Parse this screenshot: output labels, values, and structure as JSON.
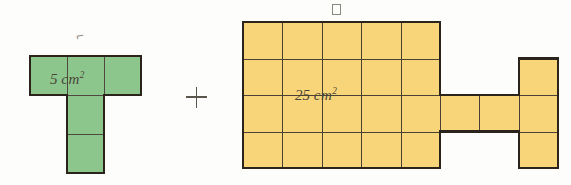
{
  "page": {
    "width": 571,
    "height": 185,
    "background": "#fdfdfb"
  },
  "colors": {
    "green_fill": "#8cc68c",
    "yellow_fill": "#f7d578",
    "grid_stroke": "#4a4033",
    "outline_stroke": "#2b241c",
    "label_text": "#4a443a",
    "tag_text": "#8d8a82"
  },
  "operator": {
    "symbol": "+",
    "name": "plus-sign",
    "x": 186,
    "y": 87
  },
  "figures": [
    {
      "id": "green-figure",
      "tag": "⌐",
      "tag_kind": "faint-mark",
      "fill": "#8cc68c",
      "area_value": "5",
      "area_unit": "cm",
      "area_exponent": "2",
      "area_label": "5 cm²",
      "cell_width": 37,
      "cell_height": 39,
      "origin_x": 30,
      "origin_y": 56,
      "grid": [
        {
          "col": 0,
          "row": 0
        },
        {
          "col": 1,
          "row": 0
        },
        {
          "col": 2,
          "row": 0
        },
        {
          "col": 1,
          "row": 1
        },
        {
          "col": 1,
          "row": 2
        }
      ],
      "cell_count": 5,
      "label_offset_x": 20,
      "label_offset_y": 14,
      "tag_offset_x": 46,
      "tag_offset_y": -28
    },
    {
      "id": "yellow-figure",
      "tag": "□",
      "tag_kind": "tofu-box",
      "fill": "#f7d578",
      "area_value": "25",
      "area_unit": "cm",
      "area_exponent": "2",
      "area_label": "25 cm²",
      "cell_width": 39.4,
      "cell_height": 36.5,
      "origin_x": 243,
      "origin_y": 22,
      "grid": [
        {
          "col": 0,
          "row": 0
        },
        {
          "col": 1,
          "row": 0
        },
        {
          "col": 2,
          "row": 0
        },
        {
          "col": 3,
          "row": 0
        },
        {
          "col": 4,
          "row": 0
        },
        {
          "col": 0,
          "row": 1
        },
        {
          "col": 1,
          "row": 1
        },
        {
          "col": 2,
          "row": 1
        },
        {
          "col": 3,
          "row": 1
        },
        {
          "col": 4,
          "row": 1
        },
        {
          "col": 0,
          "row": 2
        },
        {
          "col": 1,
          "row": 2
        },
        {
          "col": 2,
          "row": 2
        },
        {
          "col": 3,
          "row": 2
        },
        {
          "col": 4,
          "row": 2
        },
        {
          "col": 0,
          "row": 3
        },
        {
          "col": 1,
          "row": 3
        },
        {
          "col": 2,
          "row": 3
        },
        {
          "col": 3,
          "row": 3
        },
        {
          "col": 4,
          "row": 3
        },
        {
          "col": 5,
          "row": 2
        },
        {
          "col": 6,
          "row": 2
        },
        {
          "col": 7,
          "row": 1
        },
        {
          "col": 7,
          "row": 2
        },
        {
          "col": 7,
          "row": 3
        }
      ],
      "cell_count": 25,
      "label_offset_x": 52,
      "label_offset_y": 64,
      "tag_offset_x": 89,
      "tag_offset_y": -18
    }
  ]
}
